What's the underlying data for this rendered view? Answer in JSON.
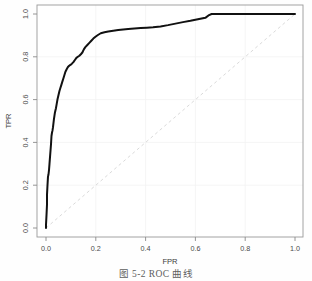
{
  "figure": {
    "caption": "图 5-2  ROC 曲线",
    "background_color": "#fefefe",
    "frame_color": "#8a8a8a"
  },
  "chart_data": {
    "type": "line",
    "title": "",
    "subtitle": "",
    "xlabel": "FPR",
    "ylabel": "TPR",
    "xlim": [
      0.0,
      1.0
    ],
    "ylim": [
      0.0,
      1.0
    ],
    "grid": true,
    "legend": null,
    "legend_position": "none",
    "xticks": [
      0.0,
      0.2,
      0.4,
      0.6,
      0.8,
      1.0
    ],
    "xtick_labels": [
      "0.0",
      "0.2",
      "0.4",
      "0.6",
      "0.8",
      "1.0"
    ],
    "yticks": [
      0.0,
      0.2,
      0.4,
      0.6,
      0.8,
      1.0
    ],
    "ytick_labels": [
      "0.0",
      "0.2",
      "0.4",
      "0.6",
      "0.8",
      "1.0"
    ],
    "series": [
      {
        "name": "ROC curve",
        "color": "#111111",
        "linewidth": 2.0,
        "linestyle": "solid",
        "x": [
          0.0,
          0.0,
          0.002,
          0.004,
          0.004,
          0.006,
          0.008,
          0.01,
          0.012,
          0.014,
          0.016,
          0.018,
          0.02,
          0.021,
          0.022,
          0.024,
          0.026,
          0.028,
          0.03,
          0.032,
          0.034,
          0.036,
          0.038,
          0.04,
          0.043,
          0.046,
          0.05,
          0.054,
          0.058,
          0.062,
          0.066,
          0.07,
          0.074,
          0.078,
          0.083,
          0.088,
          0.093,
          0.098,
          0.104,
          0.11,
          0.116,
          0.122,
          0.128,
          0.134,
          0.14,
          0.146,
          0.152,
          0.158,
          0.166,
          0.174,
          0.182,
          0.19,
          0.2,
          0.21,
          0.22,
          0.235,
          0.25,
          0.27,
          0.29,
          0.31,
          0.33,
          0.355,
          0.38,
          0.405,
          0.43,
          0.46,
          0.49,
          0.52,
          0.55,
          0.58,
          0.61,
          0.64,
          0.655,
          0.665,
          0.7,
          0.75,
          0.8,
          0.85,
          0.9,
          0.95,
          1.0
        ],
        "y": [
          0.0,
          0.015,
          0.06,
          0.11,
          0.155,
          0.2,
          0.24,
          0.25,
          0.27,
          0.3,
          0.33,
          0.36,
          0.39,
          0.41,
          0.43,
          0.445,
          0.455,
          0.47,
          0.49,
          0.51,
          0.525,
          0.54,
          0.55,
          0.56,
          0.58,
          0.6,
          0.62,
          0.64,
          0.655,
          0.67,
          0.685,
          0.7,
          0.715,
          0.73,
          0.742,
          0.752,
          0.758,
          0.762,
          0.768,
          0.775,
          0.785,
          0.795,
          0.8,
          0.805,
          0.812,
          0.82,
          0.835,
          0.845,
          0.855,
          0.865,
          0.875,
          0.885,
          0.895,
          0.903,
          0.91,
          0.915,
          0.918,
          0.922,
          0.925,
          0.928,
          0.93,
          0.932,
          0.934,
          0.936,
          0.938,
          0.942,
          0.948,
          0.955,
          0.962,
          0.968,
          0.975,
          0.982,
          0.995,
          1.0,
          1.0,
          1.0,
          1.0,
          1.0,
          1.0,
          1.0,
          1.0
        ]
      },
      {
        "name": "Random chance reference",
        "color": "#dadada",
        "linewidth": 1.0,
        "linestyle": "dashed",
        "x": [
          0.0,
          1.0
        ],
        "y": [
          0.0,
          1.0
        ]
      }
    ]
  }
}
